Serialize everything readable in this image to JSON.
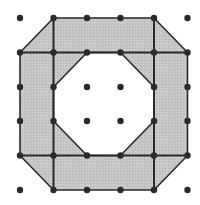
{
  "diagram": {
    "type": "dot-grid-octagonal-ring",
    "grid": {
      "columns": 6,
      "rows": 6,
      "x": [
        20,
        53.5,
        87,
        120.5,
        154,
        187.5
      ],
      "y": [
        18,
        52.5,
        87,
        121,
        155.5,
        190
      ]
    },
    "colors": {
      "background": "#ffffff",
      "fill": "#c4c4c4",
      "line": "#2a2a2a",
      "dot": "#2a2a2a"
    },
    "outer_octagon": [
      [
        1,
        0
      ],
      [
        4,
        0
      ],
      [
        5,
        1
      ],
      [
        5,
        4
      ],
      [
        4,
        5
      ],
      [
        1,
        5
      ],
      [
        0,
        4
      ],
      [
        0,
        1
      ]
    ],
    "inner_octagon": [
      [
        2,
        1
      ],
      [
        3,
        1
      ],
      [
        4,
        2
      ],
      [
        4,
        3
      ],
      [
        3,
        4
      ],
      [
        2,
        4
      ],
      [
        1,
        3
      ],
      [
        1,
        2
      ]
    ],
    "grid_lines": [
      {
        "from": [
          0,
          1
        ],
        "to": [
          5,
          1
        ]
      },
      {
        "from": [
          0,
          4
        ],
        "to": [
          5,
          4
        ]
      },
      {
        "from": [
          1,
          0
        ],
        "to": [
          1,
          5
        ]
      },
      {
        "from": [
          4,
          0
        ],
        "to": [
          4,
          5
        ]
      }
    ],
    "dots": [
      [
        0,
        0
      ],
      [
        1,
        0
      ],
      [
        2,
        0
      ],
      [
        3,
        0
      ],
      [
        4,
        0
      ],
      [
        5,
        0
      ],
      [
        0,
        1
      ],
      [
        1,
        1
      ],
      [
        2,
        1
      ],
      [
        3,
        1
      ],
      [
        4,
        1
      ],
      [
        5,
        1
      ],
      [
        0,
        2
      ],
      [
        1,
        2
      ],
      [
        2,
        2
      ],
      [
        3,
        2
      ],
      [
        4,
        2
      ],
      [
        5,
        2
      ],
      [
        0,
        3
      ],
      [
        1,
        3
      ],
      [
        2,
        3
      ],
      [
        3,
        3
      ],
      [
        4,
        3
      ],
      [
        5,
        3
      ],
      [
        0,
        4
      ],
      [
        1,
        4
      ],
      [
        2,
        4
      ],
      [
        3,
        4
      ],
      [
        4,
        4
      ],
      [
        5,
        4
      ],
      [
        0,
        5
      ],
      [
        1,
        5
      ],
      [
        2,
        5
      ],
      [
        3,
        5
      ],
      [
        4,
        5
      ],
      [
        5,
        5
      ]
    ]
  }
}
